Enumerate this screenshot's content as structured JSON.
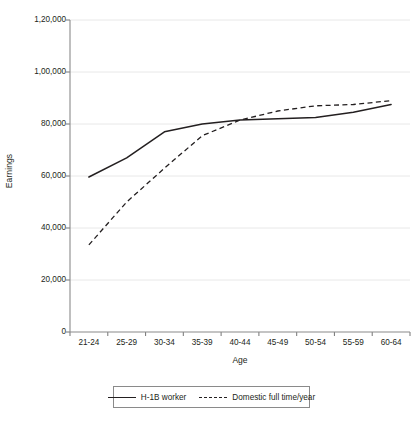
{
  "chart_data": {
    "type": "line",
    "title": "",
    "xlabel": "Age",
    "ylabel": "Earnings",
    "categories": [
      "21-24",
      "25-29",
      "30-34",
      "35-39",
      "40-44",
      "45-49",
      "50-54",
      "55-59",
      "60-64"
    ],
    "ylim": [
      0,
      120000
    ],
    "ytick_values": [
      0,
      20000,
      40000,
      60000,
      80000,
      100000,
      120000
    ],
    "ytick_labels": [
      "0",
      "20,000",
      "40,000",
      "60,000",
      "80,000",
      "1,00,000",
      "1,20,000"
    ],
    "grid": true,
    "grid_axis": "y",
    "legend_position": "bottom-center",
    "series": [
      {
        "name": "H-1B worker",
        "style": "solid",
        "color": "#231f20",
        "values": [
          59600,
          67000,
          77000,
          80000,
          81500,
          82000,
          82500,
          84500,
          87500
        ]
      },
      {
        "name": "Domestic full time/year",
        "style": "dashed",
        "color": "#231f20",
        "values": [
          33500,
          50000,
          63000,
          75500,
          81500,
          85000,
          87000,
          87500,
          89000
        ]
      }
    ]
  },
  "axis": {
    "y_title": "Earnings",
    "x_title": "Age"
  },
  "legend": {
    "entries": [
      {
        "label": "H-1B worker",
        "style": "solid"
      },
      {
        "label": "Domestic full time/year",
        "style": "dashed"
      }
    ]
  },
  "colors": {
    "series_line": "#231f20",
    "axis": "#808080",
    "grid": "#e8e8e8",
    "background": "#ffffff"
  }
}
